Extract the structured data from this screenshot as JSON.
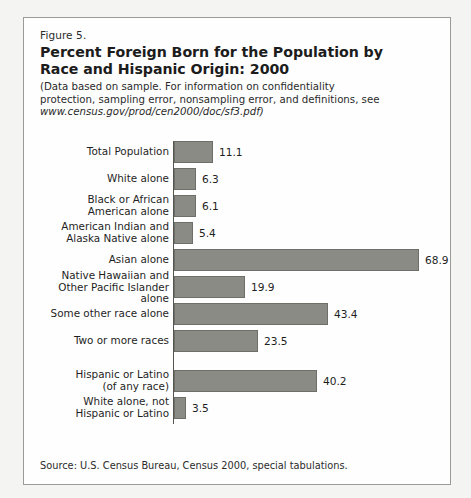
{
  "figure": {
    "number": "Figure 5.",
    "title": "Percent Foreign Born for the Population by Race and Hispanic Origin:  2000",
    "note_line1": "(Data based on sample.  For information on confidentiality",
    "note_line2": "protection, sampling error, nonsampling error, and definitions, see",
    "note_url": "www.census.gov/prod/cen2000/doc/sf3.pdf)",
    "source": "Source: U.S. Census Bureau, Census 2000, special tabulations."
  },
  "colors": {
    "bar_fill": "#8b8b85",
    "bar_stroke": "#6f6f69",
    "axis": "#55554f",
    "frame": "#9a9a96",
    "text": "#1f1f1f",
    "page_background": "#f4f4f2",
    "figure_background": "#fefefe"
  },
  "chart_data": {
    "type": "bar",
    "orientation": "horizontal",
    "title": "Percent Foreign Born for the Population by Race and Hispanic Origin:  2000",
    "subtitle": "(Data based on sample.  For information on confidentiality protection, sampling error, nonsampling error, and definitions, see www.census.gov/prod/cen2000/doc/sf3.pdf)",
    "xlabel": "",
    "ylabel": "",
    "xlim": [
      0,
      68.9
    ],
    "grid": false,
    "legend": false,
    "value_labels": true,
    "source": "Source: U.S. Census Bureau, Census 2000, special tabulations.",
    "categories": [
      "Total Population",
      "White alone",
      "Black or African American alone",
      "American Indian and Alaska Native alone",
      "Asian alone",
      "Native Hawaiian and Other Pacific Islander alone",
      "Some other race alone",
      "Two or more races",
      "Hispanic or Latino (of any race)",
      "White alone, not Hispanic or Latino"
    ],
    "values": [
      11.1,
      6.3,
      6.1,
      5.4,
      68.9,
      19.9,
      43.4,
      23.5,
      40.2,
      3.5
    ]
  },
  "bars": [
    {
      "label_line1": "Total Population",
      "label_line2": "",
      "value": 11.1,
      "value_text": "11.1",
      "group_break": false
    },
    {
      "label_line1": "White alone",
      "label_line2": "",
      "value": 6.3,
      "value_text": "6.3",
      "group_break": false
    },
    {
      "label_line1": "Black or African",
      "label_line2": "American alone",
      "value": 6.1,
      "value_text": "6.1",
      "group_break": false
    },
    {
      "label_line1": "American Indian and",
      "label_line2": "Alaska Native alone",
      "value": 5.4,
      "value_text": "5.4",
      "group_break": false
    },
    {
      "label_line1": "Asian alone",
      "label_line2": "",
      "value": 68.9,
      "value_text": "68.9",
      "group_break": false
    },
    {
      "label_line1": "Native Hawaiian and",
      "label_line2": "Other Pacific Islander alone",
      "value": 19.9,
      "value_text": "19.9",
      "group_break": false
    },
    {
      "label_line1": "Some other race alone",
      "label_line2": "",
      "value": 43.4,
      "value_text": "43.4",
      "group_break": false
    },
    {
      "label_line1": "Two or more races",
      "label_line2": "",
      "value": 23.5,
      "value_text": "23.5",
      "group_break": false
    },
    {
      "label_line1": "Hispanic or Latino",
      "label_line2": "(of any race)",
      "value": 40.2,
      "value_text": "40.2",
      "group_break": true
    },
    {
      "label_line1": "White alone, not",
      "label_line2": "Hispanic or Latino",
      "value": 3.5,
      "value_text": "3.5",
      "group_break": false
    }
  ]
}
